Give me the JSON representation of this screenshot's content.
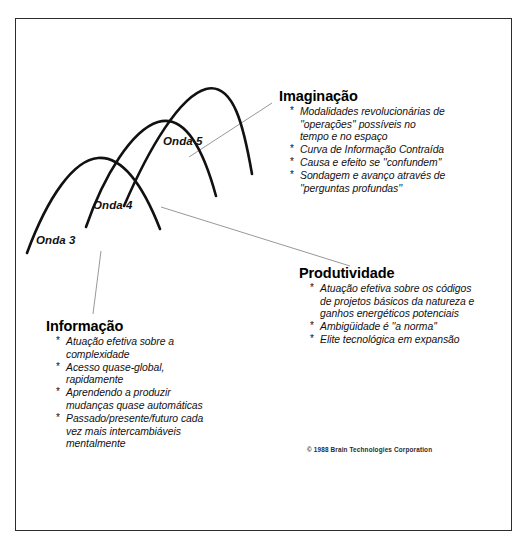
{
  "document": {
    "title": "Ondas de Mudança — Diagrama",
    "copyright": "© 1988 Brain Technologies Corporation"
  },
  "waves": [
    {
      "id": "onda-3",
      "label": "Onda 3"
    },
    {
      "id": "onda-4",
      "label": "Onda 4"
    },
    {
      "id": "onda-5",
      "label": "Onda 5"
    }
  ],
  "blocks": {
    "imaginacao": {
      "heading": "Imaginação",
      "bullets": [
        [
          "Modalidades revolucionárias de",
          "''operações'' possíveis no",
          "tempo e no espaço"
        ],
        [
          "Curva de Informação Contraída"
        ],
        [
          "Causa e efeito se ''confundem''"
        ],
        [
          "Sondagem e avanço através de",
          "''perguntas profundas''"
        ]
      ]
    },
    "produtividade": {
      "heading": "Produtividade",
      "bullets": [
        [
          "Atuação efetiva sobre os códigos",
          "de projetos básicos da natureza e",
          "ganhos energéticos potenciais"
        ],
        [
          "Ambigüidade é ''a norma''"
        ],
        [
          "Elite tecnológica em expansão"
        ]
      ]
    },
    "informacao": {
      "heading": "Informação",
      "bullets": [
        [
          "Atuação efetiva sobre a",
          "complexidade"
        ],
        [
          "Acesso quase-global,",
          "rapidamente"
        ],
        [
          "Aprendendo a produzir",
          "mudanças quase automáticas"
        ],
        [
          "Passado/presente/futuro cada",
          "vez mais intercambiáveis",
          "mentalmente"
        ]
      ]
    }
  },
  "style": {
    "frame_color": "#2c2c2c",
    "curve_color": "#111111",
    "leader_color": "#8c8c8c",
    "background": "#ffffff"
  },
  "chart_data": {
    "type": "line",
    "xlabel": "",
    "ylabel": "",
    "grid": false,
    "legend": "none",
    "series": [
      {
        "name": "Onda 3",
        "comment": "arco ascendente mais à esquerda e mais baixo",
        "path": "M 27,253 C 48,196 74,160 98,158 C 124,156 144,188 160,229"
      },
      {
        "name": "Onda 4",
        "comment": "arco intermediário",
        "path": "M 86,227 C 104,175 132,130 158,122 C 186,114 204,152 216,196"
      },
      {
        "name": "Onda 5",
        "comment": "arco mais à direita e mais alto",
        "path": "M 124,206 C 149,148 180,96 206,89 C 234,82 244,128 252,174"
      }
    ],
    "leaders": [
      {
        "from": "Onda 3",
        "to": "Informação",
        "x1": 101,
        "y1": 251,
        "x2": 93,
        "y2": 314
      },
      {
        "from": "Onda 4",
        "to": "Produtividade",
        "x1": 161,
        "y1": 207,
        "x2": 350,
        "y2": 266
      },
      {
        "from": "Onda 5",
        "to": "Imaginação",
        "x1": 189,
        "y1": 157,
        "x2": 272,
        "y2": 103
      }
    ]
  }
}
